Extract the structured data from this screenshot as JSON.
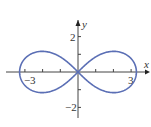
{
  "chart_data": {
    "type": "line",
    "title": "",
    "xlabel": "x",
    "ylabel": "y",
    "xlim": [
      -3.6,
      3.6
    ],
    "ylim": [
      -2.6,
      2.6
    ],
    "x_ticks": [
      -3,
      -2,
      -1,
      1,
      2,
      3
    ],
    "y_ticks": [
      -2,
      -1,
      1,
      2
    ],
    "x_tick_labels": [
      {
        "value": -3,
        "text": "−3"
      },
      {
        "value": 3,
        "text": "3"
      }
    ],
    "y_tick_labels": [
      {
        "value": 2,
        "text": "2"
      },
      {
        "value": -2,
        "text": "−2"
      }
    ],
    "grid": false,
    "series": [
      {
        "name": "lemniscate",
        "curve": "lemniscate",
        "half_width": 3.3,
        "max_height": 1.17,
        "x_intercepts": [
          -3.3,
          0,
          3.3
        ],
        "color": "#5b6fb5"
      }
    ],
    "axis_color": "#444444"
  }
}
